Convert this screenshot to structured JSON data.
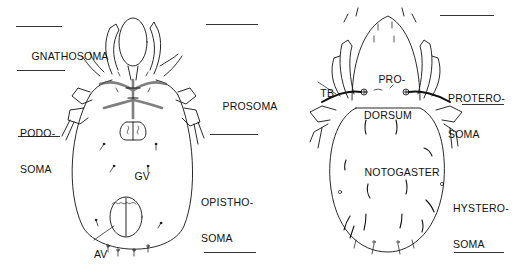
{
  "figure": {
    "left_specimen": {
      "view": "ventral",
      "left_labels": [
        {
          "id": "gnathosoma",
          "text": "GNATHOSOMA"
        },
        {
          "id": "podosoma",
          "line1": "PODO-",
          "line2": "SOMA"
        }
      ],
      "right_labels": [
        {
          "id": "prosoma",
          "text": "PROSOMA"
        },
        {
          "id": "opisthosoma",
          "line1": "OPISTHO-",
          "line2": "SOMA"
        }
      ],
      "inner_labels": [
        {
          "id": "gv",
          "text": "GV"
        },
        {
          "id": "av",
          "text": "AV"
        }
      ]
    },
    "right_specimen": {
      "view": "dorsal",
      "inner_labels": [
        {
          "id": "prodorsum",
          "line1": "PRO-",
          "line2": "DORSUM"
        },
        {
          "id": "tb",
          "text": "TB"
        },
        {
          "id": "notogaster",
          "text": "NOTOGASTER"
        }
      ],
      "right_labels": [
        {
          "id": "proterosoma",
          "line1": "PROTERO-",
          "line2": "SOMA"
        },
        {
          "id": "hysterosoma",
          "line1": "HYSTERO-",
          "line2": "SOMA"
        }
      ]
    },
    "colors": {
      "ink": "#111111",
      "background": "#ffffff",
      "stipple": "#888888"
    }
  }
}
